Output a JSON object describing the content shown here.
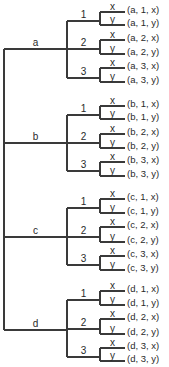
{
  "diagram": {
    "type": "tree",
    "root_x": 4,
    "level1_x": 67,
    "level2_x": 100,
    "leaf_end_x": 125,
    "label_x": 127,
    "levels": [
      {
        "name": "level-1",
        "values": [
          "a",
          "b",
          "c",
          "d"
        ]
      },
      {
        "name": "level-2",
        "values": [
          "1",
          "2",
          "3"
        ]
      },
      {
        "name": "level-3",
        "values": [
          "x",
          "y"
        ]
      }
    ],
    "groups": [
      {
        "label": "a",
        "y": 49,
        "branches": [
          {
            "label": "1",
            "y": 21,
            "leaves": [
              {
                "label": "x",
                "y": 12,
                "outcome": "(a, 1, x)"
              },
              {
                "label": "y",
                "y": 25,
                "outcome": "(a, 1, y)"
              }
            ]
          },
          {
            "label": "2",
            "y": 49,
            "leaves": [
              {
                "label": "x",
                "y": 40,
                "outcome": "(a, 2, x)"
              },
              {
                "label": "y",
                "y": 54,
                "outcome": "(a, 2, y)"
              }
            ]
          },
          {
            "label": "3",
            "y": 78,
            "leaves": [
              {
                "label": "x",
                "y": 68,
                "outcome": "(a, 3, x)"
              },
              {
                "label": "y",
                "y": 82,
                "outcome": "(a, 3, y)"
              }
            ]
          }
        ]
      },
      {
        "label": "b",
        "y": 143,
        "branches": [
          {
            "label": "1",
            "y": 115,
            "leaves": [
              {
                "label": "x",
                "y": 106,
                "outcome": "(b, 1, x)"
              },
              {
                "label": "y",
                "y": 119,
                "outcome": "(b, 1, y)"
              }
            ]
          },
          {
            "label": "2",
            "y": 143,
            "leaves": [
              {
                "label": "x",
                "y": 134,
                "outcome": "(b, 2, x)"
              },
              {
                "label": "y",
                "y": 148,
                "outcome": "(b, 2, y)"
              }
            ]
          },
          {
            "label": "3",
            "y": 171,
            "leaves": [
              {
                "label": "x",
                "y": 162,
                "outcome": "(b, 3, x)"
              },
              {
                "label": "y",
                "y": 176,
                "outcome": "(b, 3, y)"
              }
            ]
          }
        ]
      },
      {
        "label": "c",
        "y": 237,
        "branches": [
          {
            "label": "1",
            "y": 208,
            "leaves": [
              {
                "label": "x",
                "y": 199,
                "outcome": "(c, 1, x)"
              },
              {
                "label": "y",
                "y": 213,
                "outcome": "(c, 1, y)"
              }
            ]
          },
          {
            "label": "2",
            "y": 237,
            "leaves": [
              {
                "label": "x",
                "y": 227,
                "outcome": "(c, 2, x)"
              },
              {
                "label": "y",
                "y": 242,
                "outcome": "(c, 2, y)"
              }
            ]
          },
          {
            "label": "3",
            "y": 265,
            "leaves": [
              {
                "label": "x",
                "y": 256,
                "outcome": "(c, 3, x)"
              },
              {
                "label": "y",
                "y": 270,
                "outcome": "(c, 3, y)"
              }
            ]
          }
        ]
      },
      {
        "label": "d",
        "y": 330,
        "branches": [
          {
            "label": "1",
            "y": 300,
            "leaves": [
              {
                "label": "x",
                "y": 291,
                "outcome": "(d, 1, x)"
              },
              {
                "label": "y",
                "y": 305,
                "outcome": "(d, 1, y)"
              }
            ]
          },
          {
            "label": "2",
            "y": 329,
            "leaves": [
              {
                "label": "x",
                "y": 319,
                "outcome": "(d, 2, x)"
              },
              {
                "label": "y",
                "y": 334,
                "outcome": "(d, 2, y)"
              }
            ]
          },
          {
            "label": "3",
            "y": 357,
            "leaves": [
              {
                "label": "x",
                "y": 348,
                "outcome": "(d, 3, x)"
              },
              {
                "label": "y",
                "y": 361,
                "outcome": "(d, 3, y)"
              }
            ]
          }
        ]
      }
    ]
  }
}
